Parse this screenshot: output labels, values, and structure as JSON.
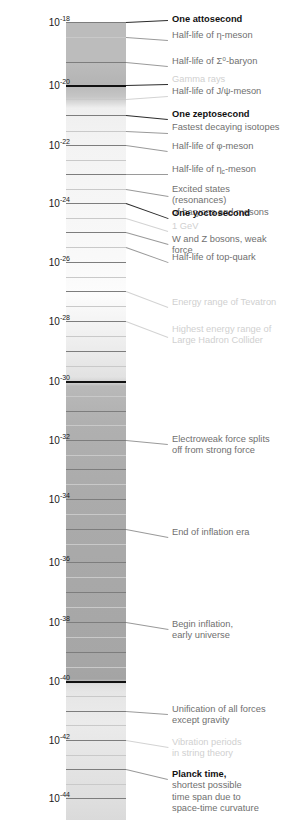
{
  "diagram": {
    "unit": "seconds",
    "axis": {
      "base": "10",
      "ticks": [
        {
          "exponent": "-18",
          "label": "10",
          "y": 22
        },
        {
          "exponent": "-20",
          "label": "10",
          "y": 85
        },
        {
          "exponent": "-22",
          "label": "10",
          "y": 145
        },
        {
          "exponent": "-24",
          "label": "10",
          "y": 203
        },
        {
          "exponent": "-26",
          "label": "10",
          "y": 262
        },
        {
          "exponent": "-28",
          "label": "10",
          "y": 321
        },
        {
          "exponent": "-30",
          "label": "10",
          "y": 381
        },
        {
          "exponent": "-32",
          "label": "10",
          "y": 440
        },
        {
          "exponent": "-34",
          "label": "10",
          "y": 499
        },
        {
          "exponent": "-36",
          "label": "10",
          "y": 562
        },
        {
          "exponent": "-38",
          "label": "10",
          "y": 622
        },
        {
          "exponent": "-40",
          "label": "10",
          "y": 681
        },
        {
          "exponent": "-42",
          "label": "10",
          "y": 740
        },
        {
          "exponent": "-44",
          "label": "10",
          "y": 798
        }
      ]
    },
    "annotations": [
      {
        "text": "One attosecond",
        "emphasis": "bold",
        "y": 20
      },
      {
        "text": "Half-life of η-meson",
        "emphasis": "normal",
        "y": 36
      },
      {
        "text": "Half-life of Σ⁰-baryon",
        "emphasis": "normal",
        "y": 62
      },
      {
        "text": "Gamma rays",
        "emphasis": "pale",
        "y": 80
      },
      {
        "text": "Half-life of J/ψ-meson",
        "emphasis": "normal",
        "y": 92
      },
      {
        "text": "One zeptosecond",
        "emphasis": "bold",
        "y": 115
      },
      {
        "text": "Fastest decaying isotopes",
        "emphasis": "normal",
        "y": 128
      },
      {
        "text": "Half-life of φ-meson",
        "emphasis": "normal",
        "y": 147
      },
      {
        "text": "Half-life of ηc-meson",
        "emphasis": "normal",
        "y": 170
      },
      {
        "text": "Excited states (resonances)\nof baryons and mesons",
        "emphasis": "normal",
        "y": 190
      },
      {
        "text": "One yoctosecond",
        "emphasis": "bold",
        "y": 214
      },
      {
        "text": "1 GeV",
        "emphasis": "pale",
        "y": 227
      },
      {
        "text": "W and Z bosons, weak force",
        "emphasis": "normal",
        "y": 240
      },
      {
        "text": "Half-life of top-quark",
        "emphasis": "normal",
        "y": 258
      },
      {
        "text": "Energy range of Tevatron",
        "emphasis": "pale",
        "y": 303
      },
      {
        "text": "Highest energy range of\nLarge Hadron Collider",
        "emphasis": "pale",
        "y": 330
      },
      {
        "text": "Electroweak force splits\noff from strong force",
        "emphasis": "normal",
        "y": 440
      },
      {
        "text": "End of inflation era",
        "emphasis": "normal",
        "y": 533
      },
      {
        "text": "Begin inflation,\nearly universe",
        "emphasis": "normal",
        "y": 625
      },
      {
        "text": "Unification of all forces\nexcept gravity",
        "emphasis": "normal",
        "y": 710
      },
      {
        "text": "Vibration periods\nin string theory",
        "emphasis": "pale",
        "y": 743
      },
      {
        "text": "Planck time,\nshortest possible\ntime span due to\nspace-time curvature",
        "emphasis": "bold-first",
        "y": 775
      }
    ]
  },
  "chart_data": {
    "type": "table",
    "ylabel": "time (s)",
    "ylim": [
      "1e-18",
      "1e-44"
    ],
    "grid": true,
    "legend": "none",
    "axis_tick_values": [
      "10^-18",
      "10^-20",
      "10^-22",
      "10^-24",
      "10^-26",
      "10^-28",
      "10^-30",
      "10^-32",
      "10^-34",
      "10^-36",
      "10^-38",
      "10^-40",
      "10^-42",
      "10^-44"
    ],
    "events": [
      {
        "label": "One attosecond",
        "value": "1e-18"
      },
      {
        "label": "Half-life of η-meson",
        "value": "5e-19"
      },
      {
        "label": "Half-life of Σ⁰-baryon",
        "value": "7e-20"
      },
      {
        "label": "Gamma rays",
        "value": "1e-20"
      },
      {
        "label": "Half-life of J/ψ-meson",
        "value": "7e-21"
      },
      {
        "label": "One zeptosecond",
        "value": "1e-21"
      },
      {
        "label": "Fastest decaying isotopes",
        "value": "5e-22"
      },
      {
        "label": "Half-life of φ-meson",
        "value": "1.5e-22"
      },
      {
        "label": "Half-life of ηc-meson",
        "value": "2e-23"
      },
      {
        "label": "Excited states (resonances) of baryons and mesons",
        "value": "1e-23"
      },
      {
        "label": "One yoctosecond",
        "value": "1e-24"
      },
      {
        "label": "1 GeV",
        "value": "6.6e-25"
      },
      {
        "label": "W and Z bosons, weak force",
        "value": "3e-25"
      },
      {
        "label": "Half-life of top-quark",
        "value": "5e-25"
      },
      {
        "label": "Energy range of Tevatron",
        "value": "1e-27"
      },
      {
        "label": "Highest energy range of Large Hadron Collider",
        "value": "1e-28"
      },
      {
        "label": "Electroweak force splits off from strong force",
        "value": "1e-32"
      },
      {
        "label": "End of inflation era",
        "value": "1e-34"
      },
      {
        "label": "Begin inflation, early universe",
        "value": "1e-38"
      },
      {
        "label": "Unification of all forces except gravity",
        "value": "1e-41"
      },
      {
        "label": "Vibration periods in string theory",
        "value": "1e-42"
      },
      {
        "label": "Planck time, shortest possible time span due to space-time curvature",
        "value": "5.4e-44"
      }
    ]
  }
}
